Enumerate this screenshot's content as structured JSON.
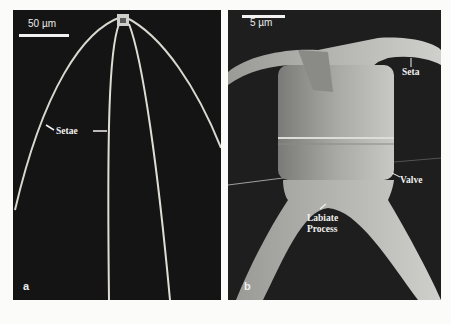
{
  "figure": {
    "panels": [
      {
        "letter": "a",
        "scale_bar": "50 µm",
        "labels": [
          "Setae"
        ]
      },
      {
        "letter": "b",
        "scale_bar": "5 µm",
        "labels": [
          "Seta",
          "Valve",
          "Labiate",
          "Process"
        ]
      }
    ]
  }
}
